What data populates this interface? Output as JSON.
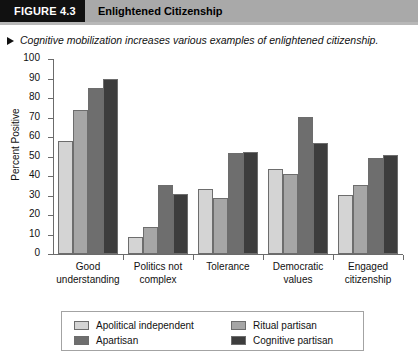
{
  "header": {
    "figure_number": "FIGURE 4.3",
    "title": "Enlightened Citizenship"
  },
  "caption": {
    "bullet_icon": "triangle-right-icon",
    "text": "Cognitive mobilization increases various examples of enlightened citizenship."
  },
  "chart_data": {
    "type": "bar",
    "title": "Enlightened Citizenship",
    "xlabel": "",
    "ylabel": "Percent Positive",
    "ylim": [
      0,
      100
    ],
    "ytick_step": 10,
    "yticks": [
      0,
      10,
      20,
      30,
      40,
      50,
      60,
      70,
      80,
      90,
      100
    ],
    "grid": false,
    "legend_position": "bottom",
    "categories": [
      "Good understanding",
      "Politics not complex",
      "Tolerance",
      "Democratic values",
      "Engaged citizenship"
    ],
    "category_lines": [
      [
        "Good",
        "understanding"
      ],
      [
        "Politics not",
        "complex"
      ],
      [
        "Tolerance",
        ""
      ],
      [
        "Democratic",
        "values"
      ],
      [
        "Engaged",
        "citizenship"
      ]
    ],
    "series": [
      {
        "name": "Apolitical independent",
        "color": "#d4d4d4",
        "values": [
          58,
          8.5,
          33.5,
          43.5,
          30.5
        ]
      },
      {
        "name": "Ritual partisan",
        "color": "#a6a6a6",
        "values": [
          74,
          14,
          28.5,
          41,
          35.5
        ]
      },
      {
        "name": "Apartisan",
        "color": "#6e6e6e",
        "values": [
          85,
          35.5,
          52,
          70.5,
          49
        ]
      },
      {
        "name": "Cognitive partisan",
        "color": "#3d3d3d",
        "values": [
          89.5,
          31,
          52.5,
          57,
          51
        ]
      }
    ]
  },
  "legend": {
    "entries": [
      {
        "label": "Apolitical independent",
        "color": "#d4d4d4"
      },
      {
        "label": "Ritual partisan",
        "color": "#a6a6a6"
      },
      {
        "label": "Apartisan",
        "color": "#6e6e6e"
      },
      {
        "label": "Cognitive partisan",
        "color": "#3d3d3d"
      }
    ]
  }
}
